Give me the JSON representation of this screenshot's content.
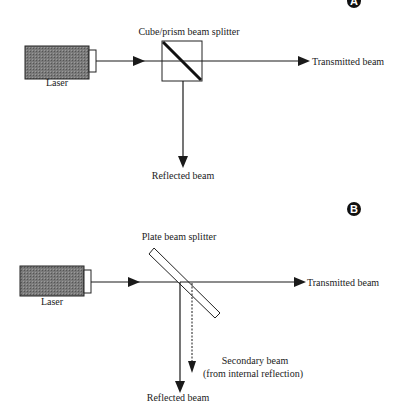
{
  "panels": [
    {
      "badge": "A",
      "laser_label": "Laser",
      "splitter_label": "Cube/prism beam splitter",
      "transmitted_label": "Transmitted beam",
      "reflected_label": "Reflected beam"
    },
    {
      "badge": "B",
      "laser_label": "Laser",
      "splitter_label": "Plate beam splitter",
      "transmitted_label": "Transmitted beam",
      "reflected_label": "Reflected beam",
      "secondary_label_line1": "Secondary beam",
      "secondary_label_line2": "(from internal reflection)"
    }
  ],
  "colors": {
    "line": "#1a1a1a",
    "laser_fill": "#6e6e6e",
    "badge": "#111111"
  }
}
